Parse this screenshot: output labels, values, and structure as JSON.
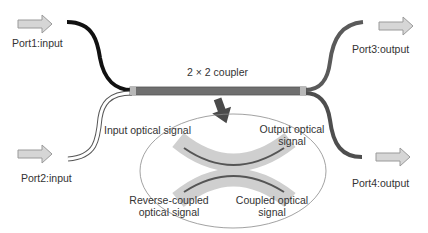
{
  "title": "2 × 2 coupler",
  "ports": {
    "port1": "Port1:input",
    "port2": "Port2:input",
    "port3": "Port3:output",
    "port4": "Port4:output"
  },
  "inset_labels": {
    "input": "Input optical signal",
    "output_l1": "Output optical",
    "output_l2": "signal",
    "reverse_l1": "Reverse-coupled",
    "reverse_l2": "optical signal",
    "coupled_l1": "Coupled optical",
    "coupled_l2": "signal"
  },
  "colors": {
    "bar": "#6f6f6f",
    "port1_fiber": "#111111",
    "right_fibers": "#5a5a5a",
    "arrow_fill": "#d6d6d6",
    "zoom_arrow": "#4a4a4a",
    "inset_band": "#cfcfcf"
  }
}
